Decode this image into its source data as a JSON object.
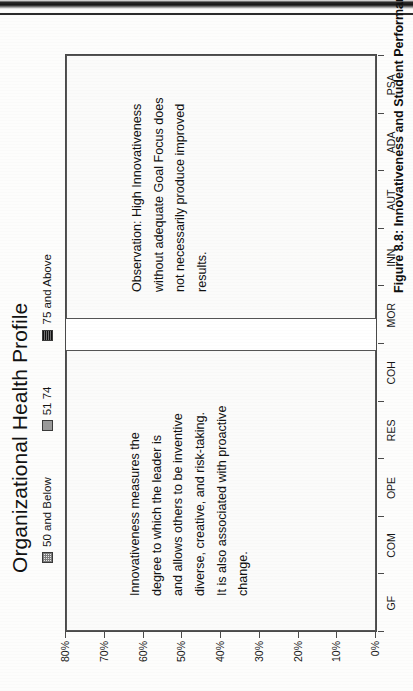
{
  "page": {
    "caption": "Figure 8.8:  Innovativeness and Student Performance"
  },
  "chart_data": {
    "type": "bar",
    "title": "Organizational Health Profile",
    "xlabel": "",
    "ylabel": "",
    "ylim": [
      0,
      80
    ],
    "ytick_labels": [
      "0%",
      "10%",
      "20%",
      "30%",
      "40%",
      "50%",
      "60%",
      "70%",
      "80%"
    ],
    "ytick_values": [
      0,
      10,
      20,
      30,
      40,
      50,
      60,
      70,
      80
    ],
    "grid": false,
    "legend_position": "top",
    "categories": [
      "GF",
      "COM",
      "OPE",
      "RES",
      "COH",
      "MOR",
      "INN",
      "AUT",
      "ADA",
      "PSA"
    ],
    "series": [
      {
        "name": "50 and Below",
        "swatch": "p1",
        "values": [
          45,
          0,
          0,
          0,
          0,
          0,
          42,
          0,
          0,
          0
        ]
      },
      {
        "name": "51 74",
        "swatch": "p2",
        "values": [
          53,
          0,
          0,
          0,
          0,
          0,
          52,
          0,
          0,
          0
        ]
      },
      {
        "name": "75 and Above",
        "swatch": "p3",
        "values": [
          80,
          0,
          0,
          0,
          0,
          0,
          61,
          0,
          0,
          0
        ]
      }
    ],
    "annotations": [
      {
        "id": "definition-panel",
        "lines": [
          "Innovativeness measures the",
          "degree to which the leader is",
          "and allows others to be inventive",
          "diverse, creative, and risk-taking.",
          "It is also associated with proactive",
          "change."
        ]
      },
      {
        "id": "observation-panel",
        "lines": [
          "Observation:  High Innovativeness",
          "without adequate Goal Focus does",
          "not necessarily produce improved",
          "results."
        ]
      }
    ]
  },
  "colors": {
    "series_low": "#ececec",
    "series_mid": "#a0a0a0",
    "series_high": "#3a3a3a",
    "axis": "#4a4a4a",
    "text": "#111111",
    "page_background": "#fdfdfc"
  }
}
